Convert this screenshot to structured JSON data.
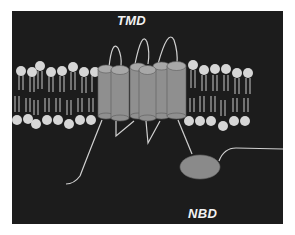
{
  "figure": {
    "title_labels": {
      "tmd": "TMD",
      "nbd": "NBD"
    },
    "colors": {
      "background": "#1c1c1c",
      "lipid_head": "#d6d6d6",
      "lipid_tail": "#c8c8c8",
      "helix_body": "#8f8f8f",
      "helix_top": "#a8a8a8",
      "nbd_domain": "#8a8a8a",
      "loop": "#d0d0d0"
    },
    "components": {
      "membrane": "lipid bilayer",
      "transmembrane_helices": 6,
      "nucleotide_binding_domain": "NBD"
    }
  }
}
